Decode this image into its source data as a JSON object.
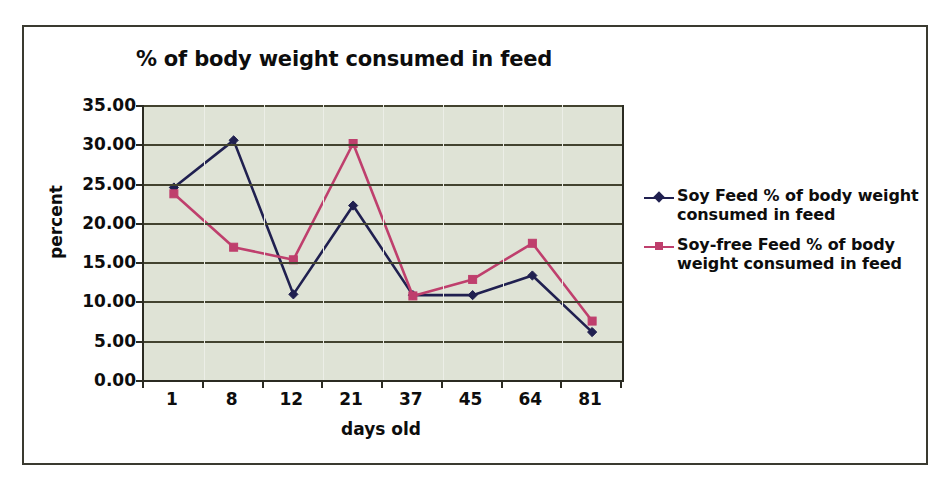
{
  "chart_data": {
    "type": "line",
    "title": "% of body weight consumed in feed",
    "xlabel": "days old",
    "ylabel": "percent",
    "categories": [
      "1",
      "8",
      "12",
      "21",
      "37",
      "45",
      "64",
      "81"
    ],
    "ylim": [
      0,
      35
    ],
    "ytick_labels": [
      "35.00",
      "30.00",
      "25.00",
      "20.00",
      "15.00",
      "10.00",
      "5.00",
      "0.00"
    ],
    "ytick_values": [
      35,
      30,
      25,
      20,
      15,
      10,
      5,
      0
    ],
    "grid": "horizontal",
    "legend_position": "right",
    "series": [
      {
        "name": "Soy Feed % of body weight consumed in feed",
        "color": "#202050",
        "marker": "diamond",
        "values": [
          24.5,
          30.5,
          10.9,
          22.2,
          10.8,
          10.8,
          13.3,
          6.1
        ]
      },
      {
        "name": "Soy-free Feed % of body weight consumed in feed",
        "color": "#bf3f6d",
        "marker": "square",
        "values": [
          23.7,
          16.9,
          15.3,
          30.1,
          10.7,
          12.8,
          17.4,
          7.5
        ]
      }
    ]
  },
  "colors": {
    "plot_background": "#dfe3d6",
    "gridline": "#43432f",
    "axis": "#2b2b22",
    "frame": "#3a3a30",
    "page_background": "#ffffff",
    "text": "#0d0d0d"
  }
}
